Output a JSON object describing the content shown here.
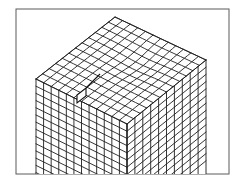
{
  "figure": {
    "description": "Finite element mesh of a 3D rectangular block viewed isometrically with a small notch/crack on the top surface",
    "frame": {
      "x": 16,
      "y": 9,
      "width": 213,
      "height": 165
    },
    "colors": {
      "background": "#ffffff",
      "frame": "#5a5a5a",
      "mesh": "#1e1e1e"
    },
    "block": {
      "top_vertex": [
        115,
        17
      ],
      "left_vertex": [
        36,
        79
      ],
      "right_vertex": [
        206,
        60
      ],
      "front_vertex": [
        127,
        124
      ],
      "bottom_y": 174,
      "top_surface_cells": {
        "along_left_edge": 12,
        "along_right_edge": 12
      },
      "left_face_columns": 12,
      "right_face_columns": 10,
      "vertical_rows": 14
    },
    "notch": {
      "points": [
        [
          77,
          95
        ],
        [
          86,
          88
        ],
        [
          86,
          96
        ],
        [
          77,
          103
        ]
      ],
      "tip": [
        100,
        74
      ]
    }
  }
}
